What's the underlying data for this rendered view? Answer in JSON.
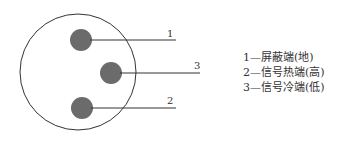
{
  "diagram": {
    "pins": [
      {
        "number": "1",
        "label": "1",
        "desc": "1—屏蔽端(地)"
      },
      {
        "number": "2",
        "label": "2",
        "desc": "2—信号热端(高)"
      },
      {
        "number": "3",
        "label": "3",
        "desc": "3—信号冷端(低)"
      }
    ],
    "colors": {
      "outline": "#333333",
      "pin_fill": "#6b6b6b",
      "text": "#333333"
    }
  }
}
